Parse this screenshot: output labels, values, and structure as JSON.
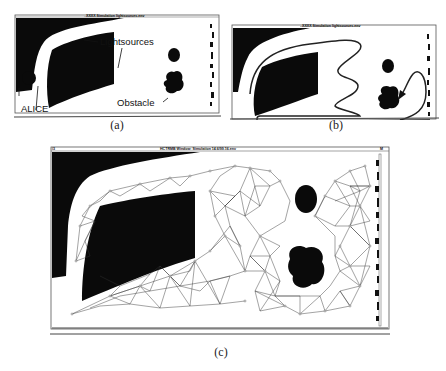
{
  "figure": {
    "panels": [
      {
        "id": "a",
        "caption": "(a)",
        "window_title": "XXXX Simulation  lightsources.env",
        "annotations": {
          "lightsources": "Lightsources",
          "alice": "ALICE",
          "obstacle": "Obstacle"
        }
      },
      {
        "id": "b",
        "caption": "(b)",
        "window_title": "XXXX Simulation  lightsources.env"
      },
      {
        "id": "c",
        "caption": "(c)",
        "window_title": "HCTRMB Window: Simulation 14.6/99.16.env",
        "corner_left": "/3",
        "corner_right": "M"
      }
    ]
  },
  "colors": {
    "background": "#ffffff",
    "obstacle": "#0a0a0a",
    "graph_edge": "#333333",
    "frame": "#444444"
  }
}
